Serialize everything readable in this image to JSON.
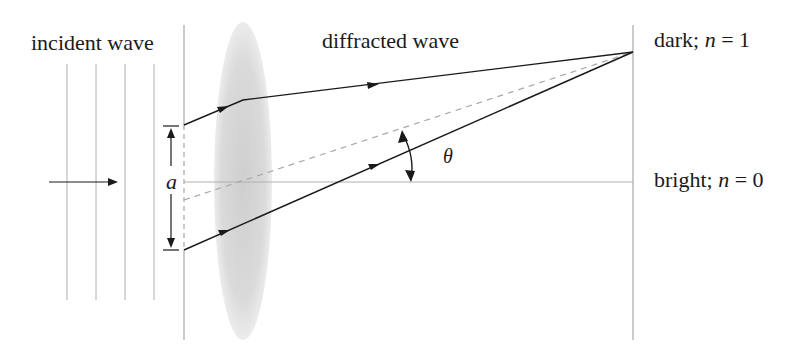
{
  "labels": {
    "incident": "incident wave",
    "diffracted": "diffracted wave",
    "dark_prefix": "dark; ",
    "dark_var": "n",
    "dark_suffix": " = 1",
    "bright_prefix": "bright; ",
    "bright_var": "n",
    "bright_suffix": " = 0",
    "slit_width": "a",
    "angle": "θ"
  },
  "colors": {
    "ray": "#1a1a1a",
    "guide": "#b5b5b5",
    "lens": "#d6d6d6"
  }
}
